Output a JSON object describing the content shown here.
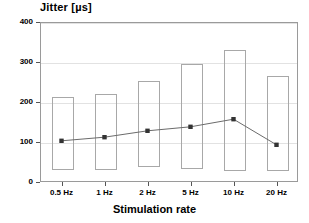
{
  "chart_data": {
    "type": "bar",
    "title": "",
    "ylabel": "Jitter [µs]",
    "xlabel": "Stimulation rate",
    "categories": [
      "0.5 Hz",
      "1 Hz",
      "2 Hz",
      "5 Hz",
      "10 Hz",
      "20 Hz"
    ],
    "ylim": [
      0,
      400
    ],
    "yticks": [
      0,
      100,
      200,
      300,
      400
    ],
    "ytick_labels": [
      "0",
      "100",
      "200",
      "300",
      "400"
    ],
    "grid": true,
    "legend": "none",
    "series": [
      {
        "name": "Jitter range (box)",
        "type": "range-bar",
        "tops": [
          215,
          222,
          255,
          297,
          333,
          268
        ],
        "bottoms": [
          32,
          32,
          40,
          35,
          30,
          30
        ]
      },
      {
        "name": "Mean jitter",
        "type": "line",
        "marker": "square",
        "values": [
          103,
          112,
          128,
          138,
          157,
          93
        ]
      }
    ],
    "colors": {
      "bar_edge": "#a8a8a8",
      "grid": "#e2e2e2",
      "axis": "#9a9a9a",
      "line": "#6b6b6b",
      "marker": "#333333",
      "text": "#000000"
    }
  }
}
